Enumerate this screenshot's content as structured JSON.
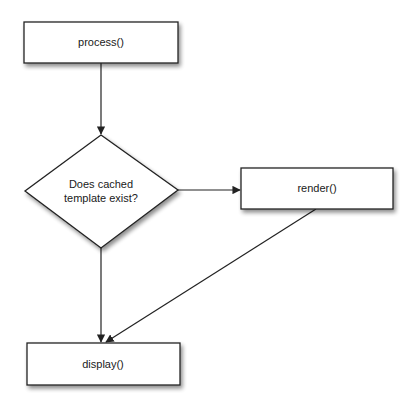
{
  "diagram": {
    "type": "flowchart",
    "colors": {
      "stroke": "#222222",
      "fill": "#ffffff",
      "shadow": "#9a9a9a",
      "text": "#1a1a1a"
    },
    "nodes": {
      "process": {
        "shape": "rectangle",
        "label": "process()"
      },
      "decision": {
        "shape": "diamond",
        "label_line1": "Does cached",
        "label_line2": "template exist?"
      },
      "render": {
        "shape": "rectangle",
        "label": "render()"
      },
      "display": {
        "shape": "rectangle",
        "label": "display()"
      }
    },
    "edges": [
      {
        "from": "process",
        "to": "decision",
        "label": ""
      },
      {
        "from": "decision",
        "to": "render",
        "label": ""
      },
      {
        "from": "decision",
        "to": "display",
        "label": ""
      },
      {
        "from": "render",
        "to": "display",
        "label": ""
      }
    ]
  }
}
